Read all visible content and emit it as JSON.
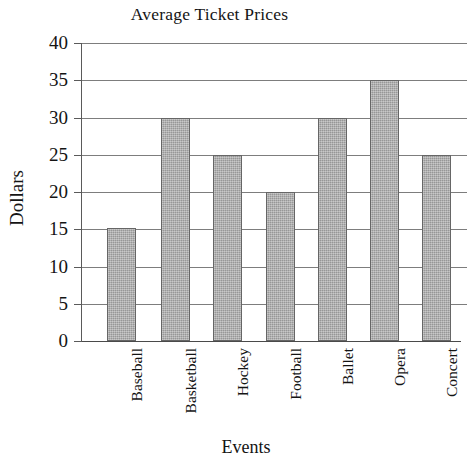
{
  "chart_data": {
    "type": "bar",
    "title": "Average Ticket Prices",
    "xlabel": "Events",
    "ylabel": "Dollars",
    "categories": [
      "Baseball",
      "Basketball",
      "Hockey",
      "Football",
      "Ballet",
      "Opera",
      "Concert"
    ],
    "values": [
      15.2,
      30,
      25,
      20,
      30,
      35,
      25
    ],
    "ylim": [
      0,
      40
    ],
    "ytick_step": 5,
    "yticks": [
      40,
      35,
      30,
      25,
      20,
      15,
      10,
      5,
      0
    ],
    "ytick_labels": [
      "40",
      "35",
      "30",
      "25",
      "20",
      "15",
      "10",
      "5",
      "0"
    ],
    "grid": true,
    "grid_axis": "y",
    "legend": null,
    "bar_fill_color": "#a9a9a9",
    "bar_edge_color": "#666666",
    "grid_color": "#7d7d7d",
    "axis_color": "#5a5a5a",
    "background_color": "#ffffff",
    "text_color": "#141414",
    "category_label_rotation": -90
  }
}
